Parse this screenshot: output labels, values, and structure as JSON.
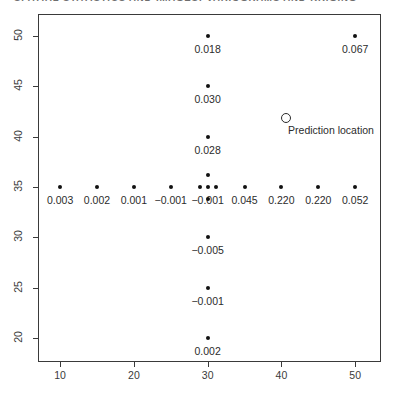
{
  "running_head": {
    "text": "SPATIAL STATISTICS AND IMAGES: VARIOGRAMS AND KRIGING"
  },
  "figure": {
    "prediction_marker": {
      "glyph": "O",
      "label": "Prediction location",
      "x": 40.5,
      "y": 42.0
    }
  },
  "chart_data": {
    "type": "scatter",
    "title": "",
    "subtitle": "",
    "xlabel": "",
    "ylabel": "",
    "xlim": [
      7.0,
      53.5
    ],
    "ylim": [
      17.6,
      52.2
    ],
    "xticks": [
      10,
      20,
      30,
      40,
      50
    ],
    "xticklabels": [
      "10",
      "20",
      "30",
      "40",
      "50"
    ],
    "yticks": [
      20,
      25,
      30,
      35,
      40,
      45,
      50
    ],
    "yticklabels": [
      "20",
      "25",
      "30",
      "35",
      "40",
      "45",
      "50"
    ],
    "grid": false,
    "legend": false,
    "marker": "filled-circle",
    "marker_color": "#111111",
    "frame_color": "#3a3a3a",
    "label_color": "#2b2b2b",
    "points": [
      {
        "x": 30.0,
        "y": 50.0,
        "label": "0.018"
      },
      {
        "x": 50.0,
        "y": 50.0,
        "label": "0.067"
      },
      {
        "x": 30.0,
        "y": 45.0,
        "label": "0.030"
      },
      {
        "x": 30.0,
        "y": 40.0,
        "label": "0.028"
      },
      {
        "x": 30.0,
        "y": 36.2,
        "label": ""
      },
      {
        "x": 10.0,
        "y": 35.0,
        "label": "0.003"
      },
      {
        "x": 15.0,
        "y": 35.0,
        "label": "0.002"
      },
      {
        "x": 20.0,
        "y": 35.0,
        "label": "0.001"
      },
      {
        "x": 25.0,
        "y": 35.0,
        "label": "-0.001"
      },
      {
        "x": 28.9,
        "y": 35.0,
        "label": ""
      },
      {
        "x": 30.0,
        "y": 35.0,
        "label": "-0.001"
      },
      {
        "x": 31.1,
        "y": 35.0,
        "label": ""
      },
      {
        "x": 35.0,
        "y": 35.0,
        "label": "0.045"
      },
      {
        "x": 40.0,
        "y": 35.0,
        "label": "0.220"
      },
      {
        "x": 45.0,
        "y": 35.0,
        "label": "0.220"
      },
      {
        "x": 50.0,
        "y": 35.0,
        "label": "0.052"
      },
      {
        "x": 30.0,
        "y": 33.8,
        "label": ""
      },
      {
        "x": 30.0,
        "y": 30.0,
        "label": "-0.005"
      },
      {
        "x": 30.0,
        "y": 25.0,
        "label": "-0.001"
      },
      {
        "x": 30.0,
        "y": 20.0,
        "label": "0.002"
      }
    ]
  }
}
